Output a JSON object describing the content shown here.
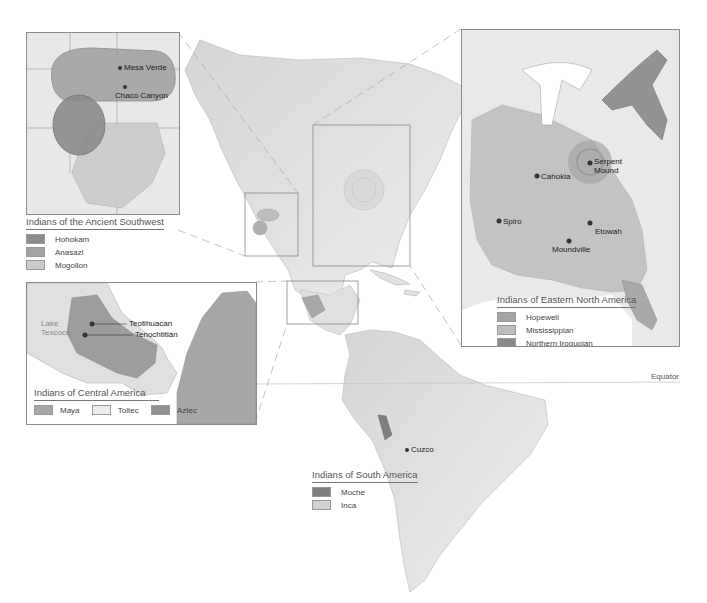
{
  "map": {
    "equator_label": "Equator",
    "colors": {
      "land": "#e6e6e6",
      "land_dark": "#cfcfcf",
      "inset_border": "#8a8a8a",
      "hohokam": "#8c8c8c",
      "anasazi": "#a3a3a3",
      "mogollon": "#cbcbcb",
      "hopewell": "#a5a5a5",
      "mississippian": "#bdbdbd",
      "northern_iroquoian": "#8a8a8a",
      "maya": "#a7a7a7",
      "toltec": "#ececec",
      "aztec": "#929292",
      "moche": "#7e7e7e",
      "inca": "#d2d2d2"
    }
  },
  "southwest": {
    "legend_title": "Indians of the Ancient Southwest",
    "legend": [
      {
        "label": "Hohokam",
        "color": "#8c8c8c"
      },
      {
        "label": "Anasazi",
        "color": "#a3a3a3"
      },
      {
        "label": "Mogollon",
        "color": "#cbcbcb"
      }
    ],
    "sites": [
      {
        "name": "Mesa Verde"
      },
      {
        "name": "Chaco Canyon"
      }
    ]
  },
  "eastern": {
    "legend_title": "Indians of Eastern North America",
    "legend": [
      {
        "label": "Hopewell",
        "color": "#a5a5a5"
      },
      {
        "label": "Mississippian",
        "color": "#bdbdbd"
      },
      {
        "label": "Northern Iroquoian",
        "color": "#8a8a8a"
      }
    ],
    "sites": [
      {
        "name": "Serpent"
      },
      {
        "name": "Mound"
      },
      {
        "name": "Cahokia"
      },
      {
        "name": "Spiro"
      },
      {
        "name": "Etowah"
      },
      {
        "name": "Moundville"
      }
    ]
  },
  "central": {
    "legend_title": "Indians of Central America",
    "legend": [
      {
        "label": "Maya",
        "color": "#a7a7a7"
      },
      {
        "label": "Toltec",
        "color": "#ececec"
      },
      {
        "label": "Aztec",
        "color": "#929292"
      }
    ],
    "sites": [
      {
        "name": "Teotihuacan"
      },
      {
        "name": "Tenochtitlán"
      }
    ],
    "lake_label_1": "Lake",
    "lake_label_2": "Texcoco"
  },
  "south": {
    "legend_title": "Indians of South America",
    "legend": [
      {
        "label": "Moche",
        "color": "#7e7e7e"
      },
      {
        "label": "Inca",
        "color": "#d2d2d2"
      }
    ],
    "sites": [
      {
        "name": "Cuzco"
      }
    ]
  }
}
